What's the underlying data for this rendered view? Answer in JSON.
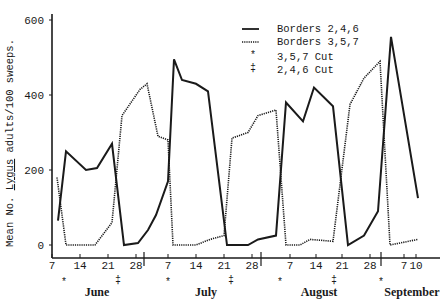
{
  "chart_data": {
    "type": "line",
    "title": "",
    "xlabel": "",
    "ylabel": "Mean No. Lygus adults/100 sweeps.",
    "ylabel_parts": {
      "pre": "Mean No. ",
      "underlined": "Lygus",
      "post": " adults/100 sweeps."
    },
    "ylim": [
      0,
      600
    ],
    "yticks": [
      0,
      200,
      400,
      600
    ],
    "grid": false,
    "legend_position": "upper right",
    "months": [
      {
        "label": "June",
        "x": 97
      },
      {
        "label": "July",
        "x": 206
      },
      {
        "label": "August",
        "x": 319
      },
      {
        "label": "September",
        "x": 412
      }
    ],
    "xticks": [
      {
        "label": "7",
        "x": 52
      },
      {
        "label": "14",
        "x": 80
      },
      {
        "label": "21",
        "x": 108
      },
      {
        "label": "28",
        "x": 136
      },
      {
        "label": "7",
        "x": 168
      },
      {
        "label": "14",
        "x": 196
      },
      {
        "label": "21",
        "x": 224
      },
      {
        "label": "28",
        "x": 252
      },
      {
        "label": "7",
        "x": 290
      },
      {
        "label": "14",
        "x": 316
      },
      {
        "label": "21",
        "x": 342
      },
      {
        "label": "28",
        "x": 370
      },
      {
        "label": "7",
        "x": 404
      },
      {
        "label": "10",
        "x": 416
      }
    ],
    "month_separators": [
      144,
      261,
      381
    ],
    "cut_markers": [
      {
        "type": "3,5,7 Cut",
        "symbol": "*",
        "x": 64
      },
      {
        "type": "2,4,6 Cut",
        "symbol": "‡",
        "x": 118
      },
      {
        "type": "3,5,7 Cut",
        "symbol": "*",
        "x": 168
      },
      {
        "type": "2,4,6 Cut",
        "symbol": "‡",
        "x": 231
      },
      {
        "type": "3,5,7 Cut",
        "symbol": "*",
        "x": 280
      },
      {
        "type": "2,4,6 Cut",
        "symbol": "‡",
        "x": 334
      },
      {
        "type": "3,5,7 Cut",
        "symbol": "*",
        "x": 381
      }
    ],
    "series": [
      {
        "name": "Borders 2,4,6",
        "style": "solid",
        "points": [
          {
            "x": 58,
            "value": 65
          },
          {
            "x": 66,
            "value": 250
          },
          {
            "x": 86,
            "value": 200
          },
          {
            "x": 97,
            "value": 205
          },
          {
            "x": 112,
            "value": 270
          },
          {
            "x": 124,
            "value": 0
          },
          {
            "x": 138,
            "value": 5
          },
          {
            "x": 148,
            "value": 40
          },
          {
            "x": 156,
            "value": 80
          },
          {
            "x": 168,
            "value": 170
          },
          {
            "x": 174,
            "value": 495
          },
          {
            "x": 182,
            "value": 440
          },
          {
            "x": 196,
            "value": 430
          },
          {
            "x": 208,
            "value": 410
          },
          {
            "x": 227,
            "value": 0
          },
          {
            "x": 232,
            "value": 0
          },
          {
            "x": 248,
            "value": 0
          },
          {
            "x": 258,
            "value": 15
          },
          {
            "x": 276,
            "value": 25
          },
          {
            "x": 286,
            "value": 380
          },
          {
            "x": 303,
            "value": 330
          },
          {
            "x": 314,
            "value": 420
          },
          {
            "x": 333,
            "value": 370
          },
          {
            "x": 348,
            "value": 0
          },
          {
            "x": 364,
            "value": 25
          },
          {
            "x": 378,
            "value": 90
          },
          {
            "x": 391,
            "value": 555
          },
          {
            "x": 418,
            "value": 125
          }
        ]
      },
      {
        "name": "Borders 3,5,7",
        "style": "dotted",
        "points": [
          {
            "x": 57,
            "value": 180
          },
          {
            "x": 66,
            "value": 0
          },
          {
            "x": 95,
            "value": 0
          },
          {
            "x": 112,
            "value": 60
          },
          {
            "x": 122,
            "value": 345
          },
          {
            "x": 140,
            "value": 415
          },
          {
            "x": 147,
            "value": 430
          },
          {
            "x": 158,
            "value": 290
          },
          {
            "x": 168,
            "value": 280
          },
          {
            "x": 173,
            "value": 0
          },
          {
            "x": 196,
            "value": 0
          },
          {
            "x": 210,
            "value": 15
          },
          {
            "x": 224,
            "value": 25
          },
          {
            "x": 232,
            "value": 285
          },
          {
            "x": 248,
            "value": 300
          },
          {
            "x": 258,
            "value": 345
          },
          {
            "x": 276,
            "value": 360
          },
          {
            "x": 286,
            "value": 0
          },
          {
            "x": 300,
            "value": 0
          },
          {
            "x": 310,
            "value": 15
          },
          {
            "x": 333,
            "value": 10
          },
          {
            "x": 350,
            "value": 375
          },
          {
            "x": 364,
            "value": 445
          },
          {
            "x": 380,
            "value": 490
          },
          {
            "x": 390,
            "value": 0
          },
          {
            "x": 418,
            "value": 15
          }
        ]
      }
    ],
    "legend": [
      {
        "label": "Borders 2,4,6",
        "symbol": "solid-line"
      },
      {
        "label": "Borders 3,5,7",
        "symbol": "dotted-line"
      },
      {
        "label": "3,5,7 Cut",
        "symbol": "*"
      },
      {
        "label": "2,4,6 Cut",
        "symbol": "‡"
      }
    ]
  }
}
